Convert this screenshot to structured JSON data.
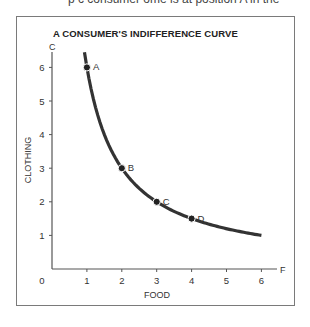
{
  "page": {
    "top_cut_text": "p   c   consumer  ome is at position A in the"
  },
  "chart_data": {
    "type": "line",
    "title": "A CONSUMER'S INDIFFERENCE CURVE",
    "xlabel": "FOOD",
    "ylabel": "CLOTHING",
    "x_axis_end_label": "F",
    "y_axis_end_label": "C",
    "xlim": [
      0,
      6
    ],
    "ylim": [
      0,
      6
    ],
    "x_ticks": [
      0,
      1,
      2,
      3,
      4,
      5,
      6
    ],
    "y_ticks": [
      1,
      2,
      3,
      4,
      5,
      6
    ],
    "origin_label": "0",
    "grid": false,
    "legend": null,
    "series": [
      {
        "name": "Indifference curve (Food × Clothing = 6)",
        "function": "y = 6 / x",
        "x_range": [
          0.93,
          6
        ],
        "color": "#333333"
      }
    ],
    "points": [
      {
        "label": "A",
        "x": 1,
        "y": 6
      },
      {
        "label": "B",
        "x": 2,
        "y": 3
      },
      {
        "label": "C",
        "x": 3,
        "y": 2
      },
      {
        "label": "D",
        "x": 4,
        "y": 1.5
      }
    ]
  }
}
